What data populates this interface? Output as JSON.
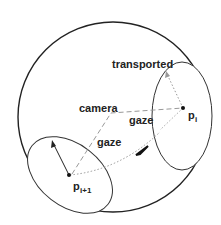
{
  "diagram": {
    "labels": {
      "transported": "transported",
      "camera": "camera",
      "gaze_upper": "gaze",
      "gaze_lower": "gaze",
      "p_i_base": "p",
      "p_i_sub": "i",
      "p_i1_base": "p",
      "p_i1_sub": "i+1"
    },
    "colors": {
      "stroke": "#222222",
      "dashed": "#999999",
      "dotted": "#999999",
      "background": "#ffffff"
    },
    "shapes": {
      "sphere": "large-circle",
      "ellipse_right": "tangent-disk-at-p_i",
      "ellipse_left": "tangent-disk-at-p_i+1"
    }
  }
}
